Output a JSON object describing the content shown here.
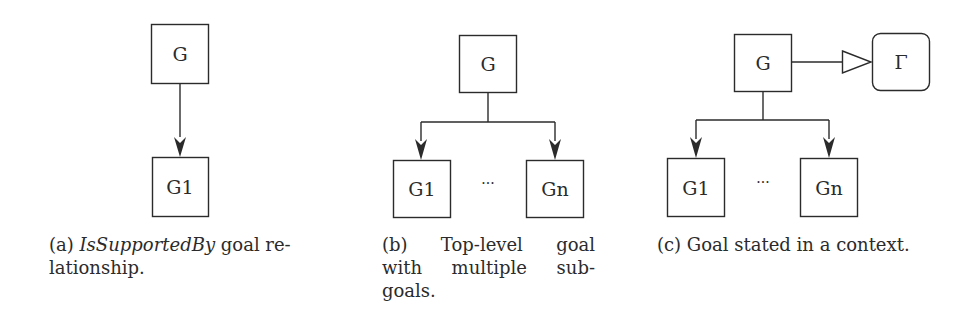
{
  "figure": {
    "panels": [
      {
        "id": "a",
        "nodes": {
          "top": "G",
          "child": "G1"
        },
        "caption": {
          "prefix": "(a) ",
          "emphasis": "IsSupportedBy",
          "line1_rest": " goal re-",
          "line2": "lationship."
        }
      },
      {
        "id": "b",
        "nodes": {
          "top": "G",
          "child_first": "G1",
          "ellipsis": "···",
          "child_last": "Gn"
        },
        "caption": {
          "line1": "(b) Top-level goal",
          "line2": "with multiple sub-",
          "line3": "goals."
        }
      },
      {
        "id": "c",
        "nodes": {
          "top": "G",
          "context": "Γ",
          "child_first": "G1",
          "ellipsis": "···",
          "child_last": "Gn"
        },
        "caption": {
          "line1": "(c) Goal stated in a context."
        }
      }
    ],
    "colors": {
      "stroke": "#2b2b2b",
      "text": "#2b2b2b",
      "background": "#ffffff"
    }
  }
}
